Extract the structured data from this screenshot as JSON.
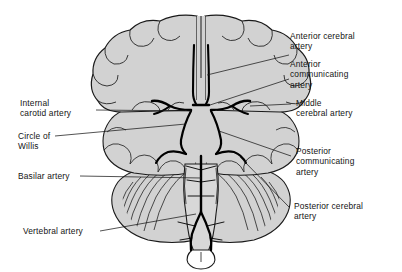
{
  "figure": {
    "view": "inferior (ventral) surface of cerebrum with arterial supply",
    "colors": {
      "brain_fill": "#d2d2d2",
      "brainstem_fill": "#d8d8d8",
      "outline": "#1a1a1a",
      "artery": "#000000",
      "leader_line": "#1a1a1a",
      "background": "#ffffff",
      "text": "#141414"
    }
  },
  "labels": {
    "anterior_cerebral_artery": "Anterior cerebral\nartery",
    "anterior_communicating_artery": "Anterior\ncommunicating\nartery",
    "middle_cerebral_artery": "Middle\ncerebral artery",
    "posterior_communicating_artery": "Posterior\ncommunicating\nartery",
    "posterior_cerebral_artery": "Posterior cerebral\nartery",
    "internal_carotid_artery": "Internal\ncarotid artery",
    "circle_of_willis": "Circle of\nWillis",
    "basilar_artery": "Basilar artery",
    "vertebral_artery": "Vertebral artery"
  },
  "structures": [
    {
      "name": "frontal-lobe-left",
      "side": "left",
      "type": "cerebral lobe"
    },
    {
      "name": "frontal-lobe-right",
      "side": "right",
      "type": "cerebral lobe"
    },
    {
      "name": "temporal-lobe-left",
      "side": "left",
      "type": "cerebral lobe"
    },
    {
      "name": "temporal-lobe-right",
      "side": "right",
      "type": "cerebral lobe"
    },
    {
      "name": "cerebellum-left",
      "side": "left",
      "type": "cerebellar hemisphere"
    },
    {
      "name": "cerebellum-right",
      "side": "right",
      "type": "cerebellar hemisphere"
    },
    {
      "name": "brainstem",
      "side": "midline",
      "type": "pons and medulla"
    }
  ],
  "arteries": [
    {
      "name": "anterior-cerebral-artery",
      "paired": true,
      "region": "midline anterior"
    },
    {
      "name": "anterior-communicating-artery",
      "paired": false,
      "region": "midline anterior"
    },
    {
      "name": "internal-carotid-artery",
      "paired": true,
      "region": "lateral"
    },
    {
      "name": "middle-cerebral-artery",
      "paired": true,
      "region": "lateral"
    },
    {
      "name": "posterior-communicating-artery",
      "paired": true,
      "region": "lateral posterior"
    },
    {
      "name": "posterior-cerebral-artery",
      "paired": true,
      "region": "posterior"
    },
    {
      "name": "basilar-artery",
      "paired": false,
      "region": "midline brainstem"
    },
    {
      "name": "vertebral-artery",
      "paired": true,
      "region": "inferior brainstem"
    }
  ]
}
